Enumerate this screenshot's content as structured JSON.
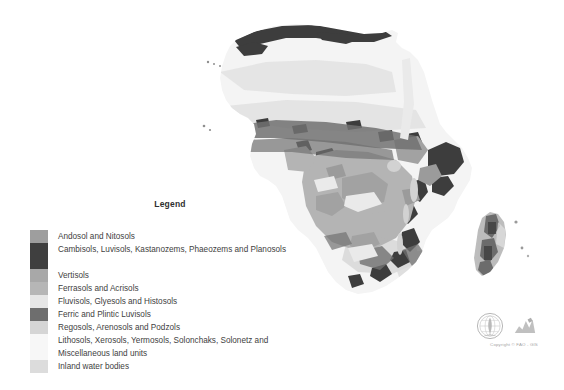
{
  "page": {
    "background": "#ffffff",
    "width": 564,
    "height": 390
  },
  "legend": {
    "title": "Legend",
    "items": [
      {
        "label": "Andosol and Nitosols",
        "color": "#9e9e9e",
        "lines": 1
      },
      {
        "label": "Cambisols, Luvisols, Kastanozems, Phaeozems and Planosols",
        "color": "#3f3f3f",
        "lines": 2
      },
      {
        "label": "Vertisols",
        "color": "#a8a8a8",
        "lines": 1
      },
      {
        "label": "Ferrasols and Acrisols",
        "color": "#b6b6b6",
        "lines": 1
      },
      {
        "label": "Fluvisols, Glyesols and Histosols",
        "color": "#e6e6e6",
        "lines": 1
      },
      {
        "label": "Ferric and Plintic Luvisols",
        "color": "#6e6e6e",
        "lines": 1
      },
      {
        "label": "Regosols, Arenosols and Podzols",
        "color": "#d5d5d5",
        "lines": 1
      },
      {
        "label": "Lithosols, Xerosols, Yermosols, Solonchaks, Solonetz and Miscellaneous land units",
        "color": "#f7f7f7",
        "lines": 2
      },
      {
        "label": "Inland water bodies",
        "color": "#dcdcdc",
        "lines": 1
      }
    ]
  },
  "map": {
    "title": "Soil map of Africa",
    "region": "Africa",
    "ocean_color": "#ffffff",
    "palette": {
      "andosol_nitosols": "#9e9e9e",
      "cambisols_luvisols": "#3f3f3f",
      "vertisols": "#a8a8a8",
      "ferrasols_acrisols": "#b6b6b6",
      "fluvisols_glyesols": "#e6e6e6",
      "ferric_plintic": "#6e6e6e",
      "regosols_arenosols": "#d5d5d5",
      "lithosols_xerosols": "#f7f7f7",
      "inland_water": "#dcdcdc"
    }
  },
  "credit": {
    "copyright": "Copyright © FAO - GIS",
    "emblem_name": "fao-emblem",
    "mark_name": "fao-mark"
  }
}
